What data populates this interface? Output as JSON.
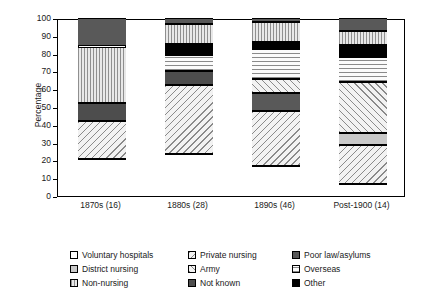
{
  "chart_data": {
    "type": "bar",
    "title": "",
    "subtitle": "",
    "xlabel": "",
    "ylabel": "Percentage",
    "ylim": [
      0,
      100
    ],
    "ytick_step": 10,
    "yticks": [
      0,
      10,
      20,
      30,
      40,
      50,
      60,
      70,
      80,
      90,
      100
    ],
    "grid": false,
    "stacked": true,
    "legend_position": "bottom",
    "categories": [
      "1870s (16)",
      "1880s (28)",
      "1890s (46)",
      "Post-1900 (14)"
    ],
    "series": [
      {
        "name": "Voluntary hospitals",
        "values": [
          21,
          23.5,
          17,
          7
        ]
      },
      {
        "name": "Private nursing",
        "values": [
          21,
          39,
          31,
          21.5
        ]
      },
      {
        "name": "District nursing",
        "values": [
          0,
          0,
          0,
          7
        ]
      },
      {
        "name": "Army",
        "values": [
          0,
          0,
          7.5,
          28.5
        ]
      },
      {
        "name": "Poor law/asylums",
        "values": [
          0,
          0,
          10,
          0
        ]
      },
      {
        "name": "Not known",
        "values": [
          10,
          7.5,
          0,
          0
        ]
      },
      {
        "name": "Overseas",
        "values": [
          0,
          9.5,
          17,
          14
        ]
      },
      {
        "name": "Other",
        "values": [
          0,
          6,
          4,
          7
        ]
      },
      {
        "name": "Non-nursing",
        "values": [
          32,
          11,
          11.5,
          7.5
        ]
      },
      {
        "name": "Poor law/asylums top",
        "values": [
          16,
          3.5,
          2,
          7.5
        ]
      }
    ],
    "bars": [
      {
        "category": "1870s (16)",
        "segments": [
          {
            "key": "voluntary",
            "label": "Voluntary hospitals",
            "start": 0,
            "end": 21
          },
          {
            "key": "private",
            "label": "Private nursing",
            "start": 21,
            "end": 42
          },
          {
            "key": "notknown",
            "label": "Not known",
            "start": 42,
            "end": 52
          },
          {
            "key": "nonnursing",
            "label": "Non-nursing",
            "start": 52,
            "end": 84
          },
          {
            "key": "poorlaw",
            "label": "Poor law/asylums",
            "start": 84,
            "end": 100
          }
        ]
      },
      {
        "category": "1880s (28)",
        "segments": [
          {
            "key": "voluntary",
            "label": "Voluntary hospitals",
            "start": 0,
            "end": 23.5
          },
          {
            "key": "private",
            "label": "Private nursing",
            "start": 23.5,
            "end": 62.5
          },
          {
            "key": "notknown",
            "label": "Not known",
            "start": 62.5,
            "end": 70
          },
          {
            "key": "overseas",
            "label": "Overseas",
            "start": 70,
            "end": 79.5
          },
          {
            "key": "other",
            "label": "Other",
            "start": 79.5,
            "end": 85.5
          },
          {
            "key": "nonnursing",
            "label": "Non-nursing",
            "start": 85.5,
            "end": 96.5
          },
          {
            "key": "poorlaw",
            "label": "Poor law/asylums",
            "start": 96.5,
            "end": 100
          }
        ]
      },
      {
        "category": "1890s (46)",
        "segments": [
          {
            "key": "voluntary",
            "label": "Voluntary hospitals",
            "start": 0,
            "end": 17
          },
          {
            "key": "private",
            "label": "Private nursing",
            "start": 17,
            "end": 48
          },
          {
            "key": "poorlaw",
            "label": "Poor law/asylums",
            "start": 48,
            "end": 58
          },
          {
            "key": "army",
            "label": "Army",
            "start": 58,
            "end": 65.5
          },
          {
            "key": "overseas",
            "label": "Overseas",
            "start": 65.5,
            "end": 82.5
          },
          {
            "key": "other",
            "label": "Other",
            "start": 82.5,
            "end": 86.5
          },
          {
            "key": "nonnursing",
            "label": "Non-nursing",
            "start": 86.5,
            "end": 98
          },
          {
            "key": "poorlaw",
            "label": "Poor law/asylums",
            "start": 98,
            "end": 100
          }
        ]
      },
      {
        "category": "Post-1900 (14)",
        "segments": [
          {
            "key": "voluntary",
            "label": "Voluntary hospitals",
            "start": 0,
            "end": 7
          },
          {
            "key": "private",
            "label": "Private nursing",
            "start": 7,
            "end": 28.5
          },
          {
            "key": "district",
            "label": "District nursing",
            "start": 28.5,
            "end": 35.5
          },
          {
            "key": "army",
            "label": "Army",
            "start": 35.5,
            "end": 64
          },
          {
            "key": "overseas",
            "label": "Overseas",
            "start": 64,
            "end": 78
          },
          {
            "key": "other",
            "label": "Other",
            "start": 78,
            "end": 85
          },
          {
            "key": "nonnursing",
            "label": "Non-nursing",
            "start": 85,
            "end": 92.5
          },
          {
            "key": "poorlaw",
            "label": "Poor law/asylums",
            "start": 92.5,
            "end": 100
          }
        ]
      }
    ],
    "legend": [
      {
        "key": "voluntary",
        "label": "Voluntary hospitals",
        "col": 0,
        "row": 0
      },
      {
        "key": "district",
        "label": "District nursing",
        "col": 0,
        "row": 1
      },
      {
        "key": "nonnursing",
        "label": "Non-nursing",
        "col": 0,
        "row": 2
      },
      {
        "key": "private",
        "label": "Private nursing",
        "col": 1,
        "row": 0
      },
      {
        "key": "army",
        "label": "Army",
        "col": 1,
        "row": 1
      },
      {
        "key": "notknown",
        "label": "Not known",
        "col": 1,
        "row": 2
      },
      {
        "key": "poorlaw",
        "label": "Poor law/asylums",
        "col": 2,
        "row": 0
      },
      {
        "key": "overseas",
        "label": "Overseas",
        "col": 2,
        "row": 1
      },
      {
        "key": "other",
        "label": "Other",
        "col": 2,
        "row": 2
      }
    ],
    "colors": {
      "voluntary": "#ffffff",
      "district": "#c9c9c9",
      "nonnursing": "#d8d8d8",
      "private": "#f0f0f0",
      "army": "#f0f0f0",
      "notknown": "#4d4d4d",
      "poorlaw": "#595959",
      "overseas": "#fbfbfb",
      "other": "#000000",
      "axis": "#000000",
      "background": "#ffffff"
    }
  }
}
